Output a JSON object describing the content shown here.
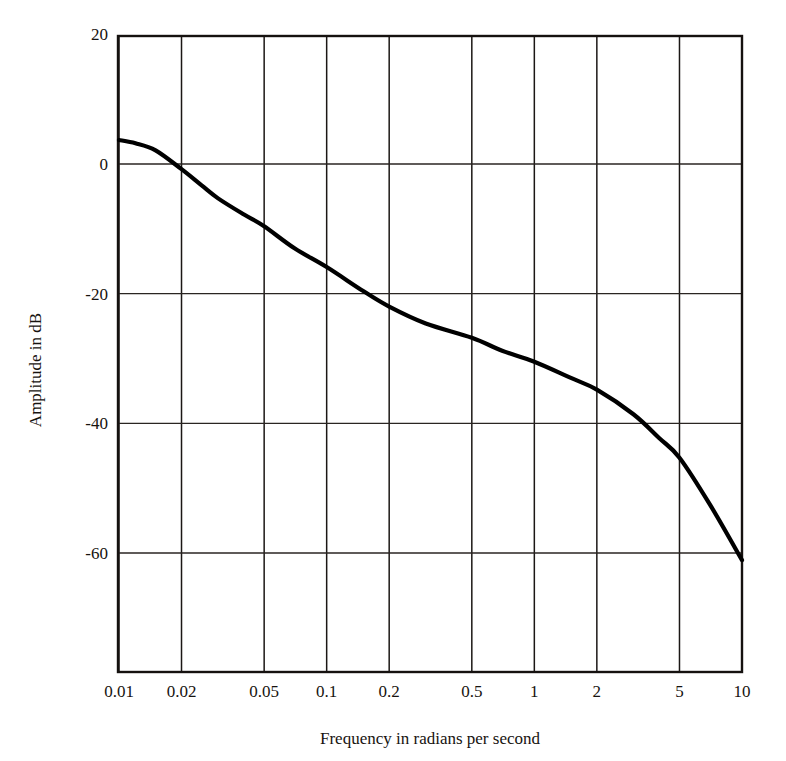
{
  "chart_data": {
    "type": "line",
    "title": "",
    "subtitle": "",
    "xlabel": "Frequency in radians per second",
    "ylabel": "Amplitude in dB",
    "xscale": "log",
    "xlim": [
      0.008,
      10
    ],
    "ylim": [
      -78.3,
      19.7
    ],
    "grid": true,
    "legend": null,
    "x_ticks": [
      {
        "value": 0.01,
        "label": "0.01"
      },
      {
        "value": 0.02,
        "label": "0.02"
      },
      {
        "value": 0.05,
        "label": "0.05"
      },
      {
        "value": 0.1,
        "label": "0.1"
      },
      {
        "value": 0.2,
        "label": "0.2"
      },
      {
        "value": 0.5,
        "label": "0.5"
      },
      {
        "value": 1,
        "label": "1"
      },
      {
        "value": 2,
        "label": "2"
      },
      {
        "value": 5,
        "label": "5"
      },
      {
        "value": 10,
        "label": "10"
      }
    ],
    "y_ticks": [
      {
        "value": 20,
        "label": "20"
      },
      {
        "value": 0,
        "label": "0"
      },
      {
        "value": -20,
        "label": "-20"
      },
      {
        "value": -40,
        "label": "-40"
      },
      {
        "value": -60,
        "label": "-60"
      }
    ],
    "series": [
      {
        "name": "amplitude",
        "color": "#000000",
        "x": [
          0.008,
          0.01,
          0.012,
          0.015,
          0.02,
          0.025,
          0.03,
          0.04,
          0.05,
          0.07,
          0.1,
          0.15,
          0.2,
          0.3,
          0.5,
          0.7,
          1.0,
          1.5,
          2.0,
          3.0,
          4.0,
          5.0,
          7.0,
          10.0
        ],
        "y": [
          3.7,
          3.7,
          3.2,
          2.1,
          -0.8,
          -3.3,
          -5.3,
          -7.8,
          -9.6,
          -13.0,
          -15.9,
          -19.6,
          -22.0,
          -24.6,
          -26.8,
          -28.8,
          -30.5,
          -33.0,
          -34.8,
          -38.6,
          -42.3,
          -45.3,
          -52.5,
          -61.1
        ]
      }
    ],
    "annotations": []
  },
  "figure": {
    "background_color": "#ffffff",
    "axis_color": "#15110f",
    "grid_color": "#1b1715",
    "curve_color": "#000000"
  }
}
